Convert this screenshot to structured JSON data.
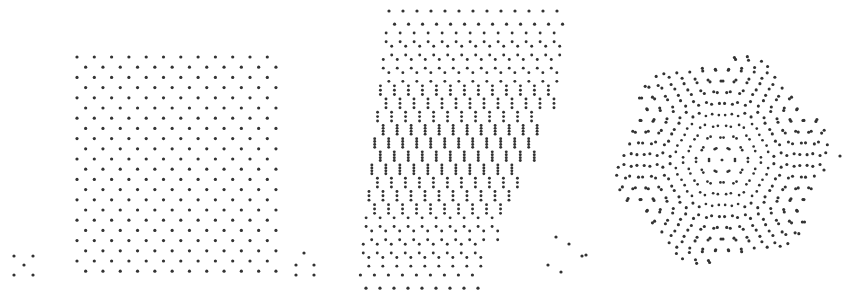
{
  "figure": {
    "width": 859,
    "height": 301,
    "background_color": "#ffffff",
    "dot_color": "#333333",
    "dot_radius": 1.6
  },
  "panels": [
    {
      "id": "panel-left",
      "name": "uniform-triangular-lattice",
      "x": 0,
      "y": 0,
      "width": 292,
      "height": 301,
      "lattice": {
        "type": "triangular",
        "origin_x": 77,
        "origin_y": 57,
        "spacing_x": 17.3,
        "spacing_y": 10.2,
        "row_offset": 8.65,
        "columns": 12,
        "rows": 22,
        "rotation_deg": 0,
        "shear": 0
      },
      "stray_dots": [
        {
          "x": 14,
          "y": 256
        },
        {
          "x": 33,
          "y": 256
        },
        {
          "x": 24,
          "y": 265
        },
        {
          "x": 14,
          "y": 275
        },
        {
          "x": 33,
          "y": 275
        }
      ]
    },
    {
      "id": "panel-middle",
      "name": "strained-subdivided-lattice",
      "x": 292,
      "y": 0,
      "width": 292,
      "height": 301,
      "lattice": {
        "type": "sheared-triangular-with-subdivision",
        "origin_x": 389,
        "origin_y": 11,
        "spacing_x": 14.0,
        "spacing_y": 13.2,
        "columns": 13,
        "rows": 22,
        "shear_per_row": -2.6,
        "subdivision_max": 4,
        "subdivision_profile": "peaks at the vertical centre of the panel and tapers to 1 at the top and bottom rows"
      },
      "stray_dots": [
        {
          "x": 304,
          "y": 253
        },
        {
          "x": 296,
          "y": 265
        },
        {
          "x": 314,
          "y": 265
        },
        {
          "x": 296,
          "y": 275
        },
        {
          "x": 314,
          "y": 275
        },
        {
          "x": 556,
          "y": 237
        },
        {
          "x": 569,
          "y": 244
        },
        {
          "x": 582,
          "y": 256
        },
        {
          "x": 548,
          "y": 265
        },
        {
          "x": 561,
          "y": 272
        }
      ]
    },
    {
      "id": "panel-right",
      "name": "moire-quasicrystal-pattern",
      "x": 584,
      "y": 0,
      "width": 275,
      "height": 301,
      "lattice": {
        "type": "moire-double-hexagonal",
        "center_x": 722,
        "center_y": 160,
        "spacing": 13.0,
        "rotation_a_deg": 4,
        "rotation_b_deg": -4,
        "hex_radius": 110,
        "rings": 10,
        "symmetry_fold": 6,
        "density_profile": "dot pairs merge toward the centre producing a dense six-fold rosette; outer rings thin out to isolated dots"
      },
      "stray_dots": [
        {
          "x": 586,
          "y": 255
        },
        {
          "x": 840,
          "y": 156
        },
        {
          "x": 824,
          "y": 170
        }
      ]
    }
  ],
  "legend": {
    "visible": false,
    "entries": []
  },
  "axes": {
    "visible": false,
    "tick_labels": []
  },
  "chart_data": {
    "type": "scatter",
    "title": "",
    "subtitle": "",
    "xlabel": "",
    "ylabel": "",
    "grid": false,
    "legend_position": "none",
    "xlim": [
      0,
      859
    ],
    "ylim": [
      0,
      301
    ],
    "series": [
      {
        "name": "uniform-triangular-lattice",
        "panel": "panel-left",
        "marker": "dot",
        "color": "#333333",
        "point_count": 269,
        "notes": "Regular triangular lattice, spacing 17.3 px horizontal, 10.2 px vertical, alternate rows offset by half a period."
      },
      {
        "name": "strained-subdivided-lattice",
        "panel": "panel-middle",
        "marker": "dot",
        "color": "#333333",
        "point_count": 1180,
        "notes": "Sheared lattice whose right edge slants left going down; each node splits into up to four vertically stacked dots, maximal near mid-height."
      },
      {
        "name": "moire-quasicrystal-pattern",
        "panel": "panel-right",
        "marker": "dot",
        "color": "#333333",
        "point_count": 880,
        "notes": "Superposition of two hexagonal lattices counter-rotated by about 4 degrees, forming a six-fold moire rosette that densifies toward the centre."
      }
    ]
  }
}
